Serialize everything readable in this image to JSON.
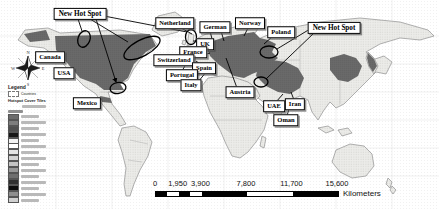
{
  "map": {
    "labels": [
      {
        "id": "new-hot-spot-west",
        "text": "New Hot Spot",
        "x": 80,
        "y": 14,
        "emphasis": true
      },
      {
        "id": "netherland",
        "text": "Netherland",
        "x": 175,
        "y": 23,
        "emphasis": false
      },
      {
        "id": "german",
        "text": "German",
        "x": 215,
        "y": 27,
        "emphasis": false
      },
      {
        "id": "norway",
        "text": "Norway",
        "x": 250,
        "y": 23,
        "emphasis": false
      },
      {
        "id": "poland",
        "text": "Poland",
        "x": 281,
        "y": 32,
        "emphasis": false
      },
      {
        "id": "new-hot-spot-east",
        "text": "New Hot Spot",
        "x": 334,
        "y": 28,
        "emphasis": true
      },
      {
        "id": "uk",
        "text": "UK",
        "x": 205,
        "y": 44,
        "emphasis": false
      },
      {
        "id": "france",
        "text": "France",
        "x": 193,
        "y": 52,
        "emphasis": false
      },
      {
        "id": "switzerland",
        "text": "Switzerland",
        "x": 174,
        "y": 60,
        "emphasis": false
      },
      {
        "id": "spain",
        "text": "Spain",
        "x": 204,
        "y": 68,
        "emphasis": false
      },
      {
        "id": "portugal",
        "text": "Portugal",
        "x": 182,
        "y": 75,
        "emphasis": false
      },
      {
        "id": "italy",
        "text": "Italy",
        "x": 191,
        "y": 85,
        "emphasis": false
      },
      {
        "id": "canada",
        "text": "Canada",
        "x": 50,
        "y": 57,
        "emphasis": false
      },
      {
        "id": "usa",
        "text": "USA",
        "x": 64,
        "y": 73,
        "emphasis": false
      },
      {
        "id": "mexico",
        "text": "Mexico",
        "x": 87,
        "y": 103,
        "emphasis": false
      },
      {
        "id": "austria",
        "text": "Austria",
        "x": 240,
        "y": 92,
        "emphasis": false
      },
      {
        "id": "uae",
        "text": "UAE",
        "x": 274,
        "y": 106,
        "emphasis": false
      },
      {
        "id": "iran",
        "text": "Iran",
        "x": 295,
        "y": 104,
        "emphasis": false
      },
      {
        "id": "oman",
        "text": "Oman",
        "x": 286,
        "y": 120,
        "emphasis": false
      }
    ],
    "compass": {
      "north": "N",
      "east": "E",
      "south": "S",
      "west": "W"
    }
  },
  "legend": {
    "title": "Legend",
    "countries_label": "Countries",
    "tiles_heading": "Hotspot Cover Tiles",
    "rows": [
      {
        "color": "#6b6b6b"
      },
      {
        "color": "#7d7d7d"
      },
      {
        "color": "#4f4f4f"
      },
      {
        "color": "#161616"
      },
      {
        "color": "#f2f2f2"
      },
      {
        "color": "#ffffff"
      },
      {
        "color": "#e3e3e3"
      },
      {
        "color": "#d2d2d2"
      },
      {
        "color": "#c4c4c4"
      },
      {
        "color": "#989898"
      },
      {
        "color": "#6f6f6f"
      },
      {
        "color": "#303030"
      },
      {
        "color": "#0d0d0d"
      },
      {
        "color": "#8e8e8e"
      },
      {
        "color": "#cfcfcf"
      }
    ]
  },
  "scale_bar": {
    "tick_labels": [
      "0",
      "1,950",
      "3,900",
      "7,800",
      "11,700",
      "15,600"
    ],
    "unit_label": "Kilometers"
  },
  "colors": {
    "land_fill": "#ecece9",
    "land_outline": "#8f8f8f",
    "hotspot_fill": "#6e6e6e",
    "annotation": "#000000"
  }
}
